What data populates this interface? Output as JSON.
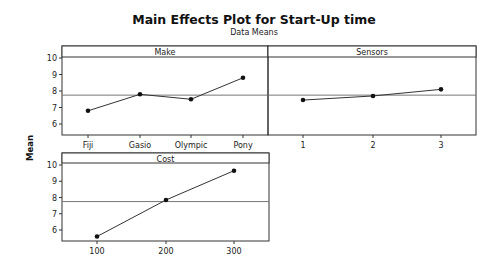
{
  "chart_data": {
    "type": "line",
    "title": "Main Effects Plot for Start-Up time",
    "subtitle": "Data Means",
    "ylabel": "Mean",
    "grand_mean": 7.75,
    "panels": [
      {
        "name": "Make",
        "categories": [
          "Fiji",
          "Gasio",
          "Olympic",
          "Pony"
        ],
        "values": [
          6.8,
          7.8,
          7.5,
          8.8
        ],
        "yticks": [
          6,
          7,
          8,
          9,
          10
        ],
        "ylim": [
          5.4,
          10.6
        ]
      },
      {
        "name": "Sensors",
        "categories": [
          "1",
          "2",
          "3"
        ],
        "values": [
          7.45,
          7.7,
          8.1
        ],
        "yticks": [
          6,
          7,
          8,
          9,
          10
        ],
        "ylim": [
          5.4,
          10.6
        ]
      },
      {
        "name": "Cost",
        "categories": [
          "100",
          "200",
          "300"
        ],
        "values": [
          5.6,
          7.85,
          9.65
        ],
        "yticks": [
          6,
          7,
          8,
          9,
          10
        ],
        "ylim": [
          5.4,
          10.6
        ]
      }
    ],
    "grid": false,
    "legend": "none"
  }
}
